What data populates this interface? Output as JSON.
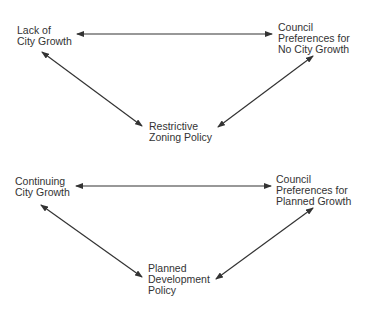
{
  "diagrams": [
    {
      "nodes": {
        "top_left": "Lack of\nCity Growth",
        "top_right": "Council\nPreferences for\nNo City Growth",
        "bottom": "Restrictive\nZoning Policy"
      },
      "edges": [
        {
          "from": "top_left",
          "to": "top_right",
          "type": "bidirectional"
        },
        {
          "from": "top_left",
          "to": "bottom",
          "type": "bidirectional"
        },
        {
          "from": "top_right",
          "to": "bottom",
          "type": "bidirectional"
        }
      ]
    },
    {
      "nodes": {
        "top_left": "Continuing\nCity Growth",
        "top_right": "Council\nPreferences for\nPlanned Growth",
        "bottom": "Planned\nDevelopment\nPolicy"
      },
      "edges": [
        {
          "from": "top_left",
          "to": "top_right",
          "type": "bidirectional"
        },
        {
          "from": "top_left",
          "to": "bottom",
          "type": "bidirectional"
        },
        {
          "from": "top_right",
          "to": "bottom",
          "type": "bidirectional"
        }
      ]
    }
  ]
}
